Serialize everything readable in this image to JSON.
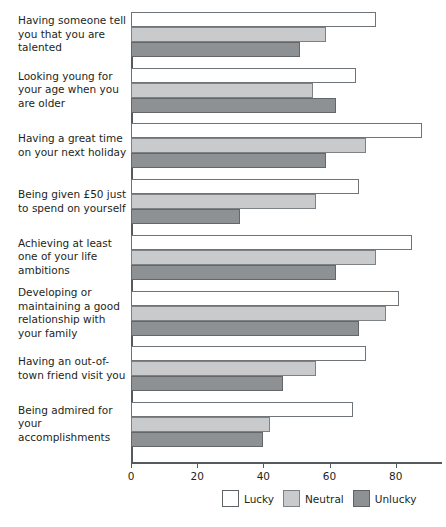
{
  "chart_data": {
    "type": "bar",
    "orientation": "horizontal",
    "title": "",
    "subtitle": "",
    "xlabel": "",
    "ylabel": "",
    "xlim": [
      0,
      94
    ],
    "xticks": [
      0,
      20,
      40,
      60,
      80
    ],
    "xtick_labels": [
      "0",
      "20",
      "40",
      "60",
      "80"
    ],
    "grid": false,
    "legend_position": "bottom-center",
    "categories": [
      "Having someone tell you that you are talented",
      "Looking young for your age when you are older",
      "Having a great time on your next holiday",
      "Being given £50 just to spend on yourself",
      "Achieving at least one of your life ambitions",
      "Developing or maintaining a good relationship with your family",
      "Having an out-of-town friend visit you",
      "Being admired for your accomplishments"
    ],
    "series": [
      {
        "name": "Lucky",
        "color": "#ffffff",
        "values": [
          74,
          68,
          88,
          69,
          85,
          81,
          71,
          67
        ]
      },
      {
        "name": "Neutral",
        "color": "#c9cacb",
        "values": [
          59,
          55,
          71,
          56,
          74,
          77,
          56,
          42
        ]
      },
      {
        "name": "Unlucky",
        "color": "#8e9194",
        "values": [
          51,
          62,
          59,
          33,
          62,
          69,
          46,
          40
        ]
      }
    ]
  },
  "legend": {
    "items": [
      {
        "label": "Lucky"
      },
      {
        "label": "Neutral"
      },
      {
        "label": "Unlucky"
      }
    ]
  }
}
